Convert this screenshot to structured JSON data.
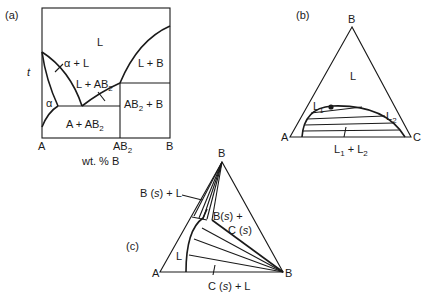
{
  "panels": {
    "a": {
      "tag": "(a)",
      "y_axis_label": "t",
      "x_axis_label": "wt. % B",
      "x_ticks": [
        {
          "base": "A",
          "sub": ""
        },
        {
          "base": "AB",
          "sub": "2"
        },
        {
          "base": "B",
          "sub": ""
        }
      ],
      "regions": {
        "liquid": "L",
        "alpha_liquid": "α + L",
        "liquid_ab2": {
          "base": "L + AB",
          "sub": "2"
        },
        "liquid_b": "L + B",
        "alpha": "α",
        "a_ab2": {
          "base": "A + AB",
          "sub": "2"
        },
        "ab2_b": {
          "base": "AB",
          "sub": "2",
          "rest": " + B"
        }
      }
    },
    "b": {
      "tag": "(b)",
      "vertices": {
        "top": "B",
        "left": "A",
        "right": "C"
      },
      "regions": {
        "liquid": "L",
        "l1": {
          "base": "L",
          "sub": "1"
        },
        "l2": {
          "base": "L",
          "sub": "2"
        },
        "two_liquid": {
          "base1": "L",
          "sub1": "1",
          "plus": " + ",
          "base2": "L",
          "sub2": "2"
        }
      }
    },
    "c": {
      "tag": "(c)",
      "vertices": {
        "top": "B",
        "left": "A",
        "right": "B"
      },
      "regions": {
        "bs_l": {
          "pre": "B (",
          "it": "s",
          "post": ") + L"
        },
        "bs_cs_1": {
          "pre": "B(",
          "it": "s",
          "post": ") +"
        },
        "bs_cs_2": {
          "pre": "C (",
          "it": "s",
          "post": ")"
        },
        "liquid": "L",
        "cs_l": {
          "pre": "C (",
          "it": "s",
          "post": ") + L"
        }
      }
    }
  }
}
